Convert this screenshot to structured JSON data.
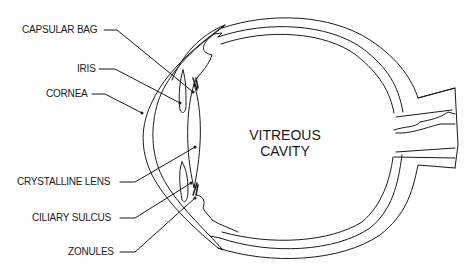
{
  "diagram": {
    "stroke_color": "#1a1a1a",
    "background": "#ffffff",
    "labels": [
      {
        "id": "capsular-bag",
        "text": "CAPSULAR BAG"
      },
      {
        "id": "iris",
        "text": "IRIS"
      },
      {
        "id": "cornea",
        "text": "CORNEA"
      },
      {
        "id": "crystalline-lens",
        "text": "CRYSTALLINE LENS"
      },
      {
        "id": "ciliary-sulcus",
        "text": "CILIARY SULCUS"
      },
      {
        "id": "zonules",
        "text": "ZONULES"
      }
    ],
    "center_label": {
      "line1": "VITREOUS",
      "line2": "CAVITY"
    }
  }
}
